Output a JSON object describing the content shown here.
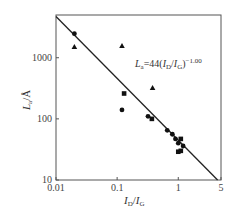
{
  "chart_data": {
    "type": "scatter",
    "title": "",
    "xlabel": "I_D/I_G",
    "ylabel": "L_a/Å",
    "xscale": "log",
    "yscale": "log",
    "xlim": [
      0.01,
      5
    ],
    "ylim": [
      10,
      5000
    ],
    "x_ticks": [
      "0.01",
      "0.1",
      "1",
      "5"
    ],
    "y_ticks": [
      "10",
      "100",
      "1000"
    ],
    "grid": false,
    "legend": null,
    "annotation": {
      "text_main": "L",
      "text_sub": "a",
      "text_eq": "=44(",
      "text_i1": "I",
      "text_sub1": "D",
      "text_slash": "/",
      "text_i2": "I",
      "text_sub2": "G",
      "text_close": ")",
      "text_exp": "−1.00",
      "full": "La=44(ID/IG)^-1.00"
    },
    "fit_line": {
      "coefficient": 44,
      "exponent": -1.0,
      "x_range": [
        0.0088,
        5
      ]
    },
    "series": [
      {
        "name": "circles",
        "marker": "circle",
        "points": [
          [
            0.02,
            2470
          ],
          [
            0.12,
            140
          ],
          [
            0.32,
            110
          ],
          [
            0.66,
            65
          ],
          [
            0.8,
            56
          ],
          [
            0.9,
            47
          ],
          [
            1.0,
            40
          ],
          [
            1.2,
            36
          ]
        ]
      },
      {
        "name": "squares",
        "marker": "square",
        "points": [
          [
            0.13,
            260
          ],
          [
            0.37,
            100
          ],
          [
            1.1,
            47
          ],
          [
            1.0,
            29
          ],
          [
            1.1,
            30
          ]
        ]
      },
      {
        "name": "triangles",
        "marker": "triangle",
        "points": [
          [
            0.02,
            1500
          ],
          [
            0.12,
            1550
          ],
          [
            0.38,
            320
          ]
        ]
      }
    ]
  },
  "labels": {
    "x_axis": {
      "i1": "I",
      "s1": "D",
      "slash": "/",
      "i2": "I",
      "s2": "G"
    },
    "y_axis": {
      "i": "L",
      "s": "a",
      "unit": "/Å"
    }
  }
}
